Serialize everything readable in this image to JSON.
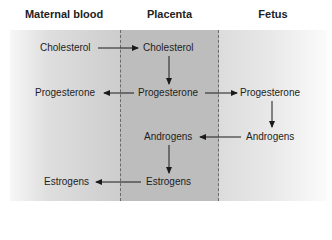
{
  "columns": {
    "maternal": "Maternal blood",
    "placenta": "Placenta",
    "fetus": "Fetus"
  },
  "nodes": {
    "maternal_cholesterol": "Cholesterol",
    "placenta_cholesterol": "Cholesterol",
    "maternal_progesterone": "Progesterone",
    "placenta_progesterone": "Progesterone",
    "fetal_progesterone": "Progesterone",
    "placenta_androgens": "Androgens",
    "fetal_androgens": "Androgens",
    "placenta_estrogens": "Estrogens",
    "maternal_estrogens": "Estrogens"
  },
  "edges": [
    {
      "from": "maternal_cholesterol",
      "to": "placenta_cholesterol"
    },
    {
      "from": "placenta_cholesterol",
      "to": "placenta_progesterone"
    },
    {
      "from": "placenta_progesterone",
      "to": "maternal_progesterone"
    },
    {
      "from": "placenta_progesterone",
      "to": "fetal_progesterone"
    },
    {
      "from": "fetal_progesterone",
      "to": "fetal_androgens"
    },
    {
      "from": "fetal_androgens",
      "to": "placenta_androgens"
    },
    {
      "from": "placenta_androgens",
      "to": "placenta_estrogens"
    },
    {
      "from": "placenta_estrogens",
      "to": "maternal_estrogens"
    }
  ],
  "colors": {
    "placenta_band": "#bdbdbd",
    "divider": "#6a6a6a",
    "arrow": "#1a1a1a"
  }
}
